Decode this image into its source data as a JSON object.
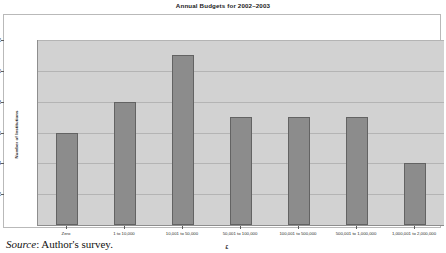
{
  "chart_data": {
    "type": "bar",
    "title": "Annual Budgets for 2002–2003",
    "xlabel": "£",
    "ylabel": "Number of Institutions",
    "categories": [
      "Zero",
      "1 to 10,000",
      "10,001 to 50,000",
      "50,001 to 100,000",
      "100,001 to 500,000",
      "500,001 to 1,000,000",
      "1,000,001 to 2,000,000"
    ],
    "values": [
      6,
      8,
      11,
      7,
      7,
      7,
      4
    ],
    "ylim": [
      0,
      12
    ],
    "yticks": [
      2,
      4,
      6,
      8,
      10,
      12
    ],
    "ytick_labels": [
      "2",
      "4",
      "6",
      "8",
      "10",
      "12"
    ],
    "grid": true,
    "legend": "none",
    "colors": {
      "bar_fill": "#8c8c8c",
      "bar_edge": "#636363",
      "plot_background": "#d2d2d2",
      "gridline": "#b4b4b4",
      "axis": "#8e8e8e",
      "text": "#1f1f1f"
    }
  },
  "caption": {
    "source_word": "Source",
    "source_rest": ": Author's survey."
  }
}
